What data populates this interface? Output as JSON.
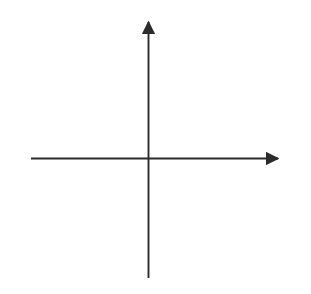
{
  "chart_data": {
    "type": "scatter",
    "title": "",
    "xlabel": "x",
    "ylabel": "y",
    "xlim": [
      -5,
      5
    ],
    "ylim": [
      -5,
      5
    ],
    "grid": true,
    "grid_style": "dotted",
    "grid_spacing": 1,
    "legend": null,
    "series": [],
    "values": [],
    "x": [],
    "xticks": [
      -5,
      -4,
      -3,
      -2,
      -1,
      1,
      2,
      3,
      4,
      5
    ],
    "yticks": [
      -5,
      -4,
      -3,
      -2,
      -1,
      1,
      2,
      3,
      4,
      5
    ],
    "xtick_labels": [
      "−5",
      "−4",
      "−3",
      "−2",
      "−1",
      "1",
      "2",
      "3",
      "4",
      "5"
    ],
    "ytick_labels": [
      "−5",
      "−4",
      "−3",
      "−2",
      "−1",
      "1",
      "2",
      "3",
      "4",
      "5"
    ],
    "annotations": [],
    "colors": {
      "grid": "#d8d8d8",
      "axis": "#2b2b2b",
      "label": "#1a1a1a",
      "background": "#ffffff"
    }
  },
  "axes": {
    "x_label": "x",
    "y_label": "y",
    "origin_label": ""
  },
  "x_ticks": [
    {
      "value": -5,
      "label": "−5"
    },
    {
      "value": -4,
      "label": "−4"
    },
    {
      "value": -3,
      "label": "−3"
    },
    {
      "value": -2,
      "label": "−2"
    },
    {
      "value": -1,
      "label": "−1"
    },
    {
      "value": 1,
      "label": "1"
    },
    {
      "value": 2,
      "label": "2"
    },
    {
      "value": 3,
      "label": "3"
    },
    {
      "value": 4,
      "label": "4"
    },
    {
      "value": 5,
      "label": "5"
    }
  ],
  "y_ticks": [
    {
      "value": 5,
      "label": "5"
    },
    {
      "value": 4,
      "label": "4"
    },
    {
      "value": 3,
      "label": "3"
    },
    {
      "value": 2,
      "label": "2"
    },
    {
      "value": 1,
      "label": "1"
    },
    {
      "value": -1,
      "label": "−1"
    },
    {
      "value": -2,
      "label": "−2"
    },
    {
      "value": -3,
      "label": "−3"
    },
    {
      "value": -4,
      "label": "−4"
    },
    {
      "value": -5,
      "label": "−5"
    }
  ]
}
